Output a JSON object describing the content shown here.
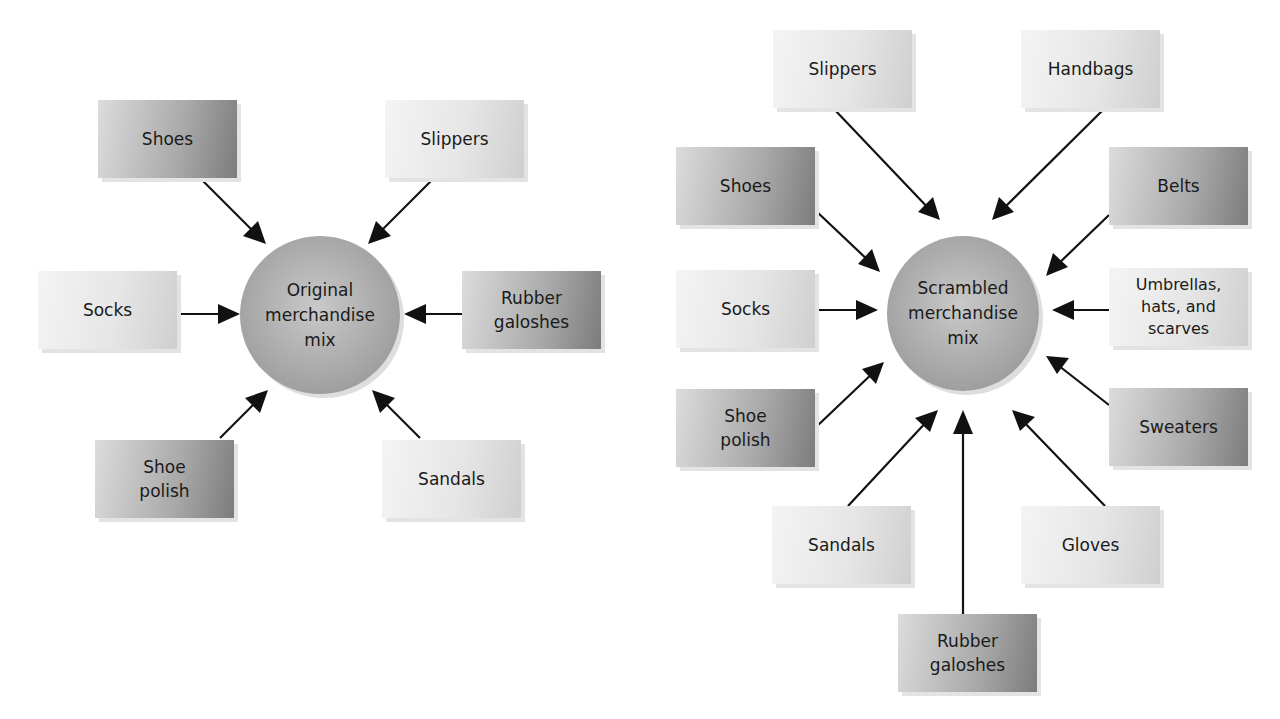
{
  "left_diagram": {
    "hub": {
      "label": "Original\nmerchandise\nmix"
    },
    "items": [
      {
        "label": "Shoes",
        "shade": "dark"
      },
      {
        "label": "Slippers",
        "shade": "light"
      },
      {
        "label": "Socks",
        "shade": "light"
      },
      {
        "label": "Rubber\ngaloshes",
        "shade": "dark"
      },
      {
        "label": "Shoe\npolish",
        "shade": "dark"
      },
      {
        "label": "Sandals",
        "shade": "light"
      }
    ]
  },
  "right_diagram": {
    "hub": {
      "label": "Scrambled\nmerchandise\nmix"
    },
    "items": [
      {
        "label": "Slippers",
        "shade": "light"
      },
      {
        "label": "Handbags",
        "shade": "light"
      },
      {
        "label": "Shoes",
        "shade": "dark"
      },
      {
        "label": "Belts",
        "shade": "dark"
      },
      {
        "label": "Socks",
        "shade": "light"
      },
      {
        "label": "Umbrellas,\nhats, and\nscarves",
        "shade": "light"
      },
      {
        "label": "Shoe\npolish",
        "shade": "dark"
      },
      {
        "label": "Sweaters",
        "shade": "dark"
      },
      {
        "label": "Sandals",
        "shade": "light"
      },
      {
        "label": "Gloves",
        "shade": "light"
      },
      {
        "label": "Rubber\ngaloshes",
        "shade": "dark"
      }
    ]
  },
  "colors": {
    "arrow": "#111111",
    "box_light": "#e6e6e6",
    "box_dark": "#a0a0a0",
    "hub": "#a9a9a9"
  }
}
